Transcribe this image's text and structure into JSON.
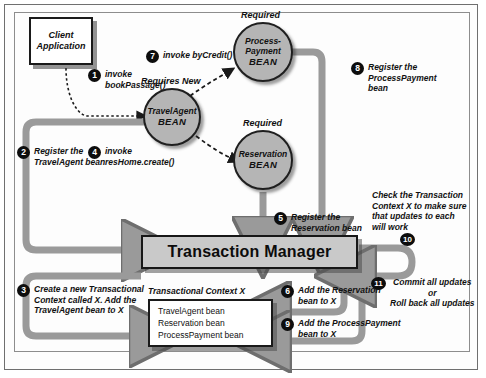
{
  "diagram": {
    "colors": {
      "bean_fill": "#b5b5b5",
      "bar_fill": "#c9c9c9",
      "arrow_gray": "#9a9a9a",
      "outline": "#1a1a1a",
      "background": "#fdfdfd"
    },
    "client": {
      "line1": "Client",
      "line2": "Application"
    },
    "beans": [
      {
        "name": "travelagent",
        "line1": "TravelAgent",
        "line2": "BEAN",
        "attribute": "Requires New"
      },
      {
        "name": "processpayment",
        "line1": "Process-",
        "line1b": "Payment",
        "line2": "BEAN",
        "attribute": "Required"
      },
      {
        "name": "reservation",
        "line1": "Reservation",
        "line2": "BEAN",
        "attribute": "Required"
      }
    ],
    "transaction_manager": {
      "label": "Transaction Manager"
    },
    "context": {
      "caption": "Transactional Context X",
      "items": [
        "TravelAgent bean",
        "Reservation bean",
        "ProcessPayment bean"
      ]
    },
    "steps": [
      {
        "num": "1",
        "text": "invoke\nbookPassage()"
      },
      {
        "num": "2",
        "text": "Register the\nTravelAgent bean"
      },
      {
        "num": "3",
        "text": "Create a new Transactional\nContext called X. Add the\nTravelAgent bean to X"
      },
      {
        "num": "4",
        "text": "invoke\nresHome.create()"
      },
      {
        "num": "5",
        "text": "Register the\nReservation bean"
      },
      {
        "num": "6",
        "text": "Add the Reservation\nbean to X"
      },
      {
        "num": "7",
        "text": "invoke byCredit()"
      },
      {
        "num": "8",
        "text": "Register the ProcessPayment\nbean"
      },
      {
        "num": "9",
        "text": "Add the ProcessPayment\nbean to X"
      },
      {
        "num": "10",
        "text": "Check the Transaction\nContext X to make sure\nthat updates to each\nwill work"
      },
      {
        "num": "11",
        "text": "Commit all updates\nor\nRoll back all updates"
      }
    ]
  }
}
